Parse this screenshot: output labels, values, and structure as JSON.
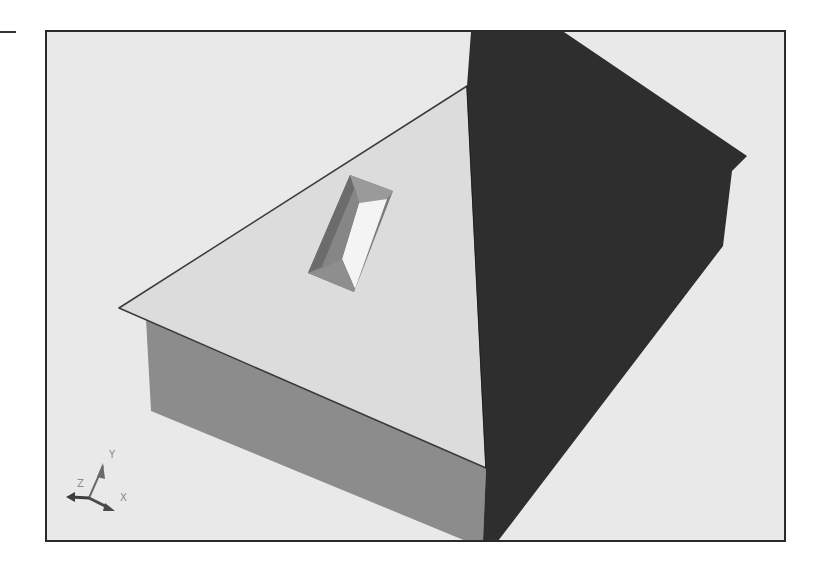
{
  "figure": {
    "colors": {
      "background": "#e9e9e9",
      "frame": "#2a2a2a",
      "roof_light": "#dcdcdc",
      "roof_dark": "#2e2e2e",
      "wall": "#8c8c8c",
      "skylight_dark": "#6f6f6f",
      "skylight_mid": "#9a9a9a",
      "skylight_light": "#f4f4f4"
    }
  },
  "ucs_icon": {
    "x_label": "X",
    "y_label": "Y",
    "z_label": "Z"
  }
}
